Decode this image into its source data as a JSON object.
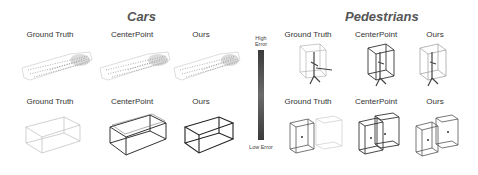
{
  "sections": {
    "cars": {
      "title": "Cars"
    },
    "pedestrians": {
      "title": "Pedestrians"
    }
  },
  "columns": {
    "ground_truth": "Ground Truth",
    "centerpoint": "CenterPoint",
    "ours": "Ours"
  },
  "colorbar": {
    "top_label": "High Error",
    "bottom_label": "Low Error",
    "colors": [
      "#3a3a3a",
      "#6a6a6a",
      "#3a3a3a"
    ]
  }
}
